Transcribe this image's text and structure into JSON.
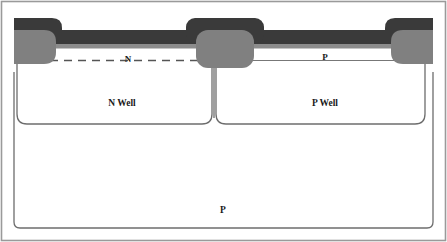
{
  "figure": {
    "kind": "cmos-cross-section",
    "width": 447,
    "height": 242
  },
  "colors": {
    "background": "#ffffff",
    "frame_border": "#9a9a9a",
    "metal_dark": "#3a3a3a",
    "contact_gray": "#808080",
    "oxide_band": "#8c8c8c",
    "junction_line": "#555555",
    "well_outline": "#6d6d6d",
    "text": "#1a1a1a"
  },
  "labels": {
    "n_diffusion": "N",
    "p_diffusion": "P",
    "n_well": "N Well",
    "p_well": "P Well",
    "substrate": "P"
  },
  "layers": {
    "metal_label": "metal-interconnect-layer",
    "contacts": [
      {
        "name": "contact-left",
        "label": ""
      },
      {
        "name": "contact-middle",
        "label": ""
      },
      {
        "name": "contact-right",
        "label": ""
      }
    ]
  }
}
